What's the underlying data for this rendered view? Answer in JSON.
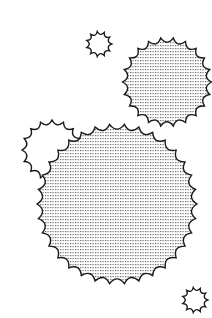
{
  "canvas": {
    "width": 212,
    "height": 318,
    "background": "#ffffff"
  },
  "style": {
    "stroke": "#1a1a1a",
    "stroke_width": 1.4,
    "dot_color": "#6a6a6a"
  },
  "shapes": [
    {
      "name": "small-star-top",
      "cx": 99,
      "cy": 44,
      "r": 10,
      "teeth": 11,
      "depth": 2.6,
      "filled": false
    },
    {
      "name": "medium-scalloped-circle",
      "cx": 167,
      "cy": 82,
      "r": 40,
      "teeth": 22,
      "depth": 4.5,
      "filled": true
    },
    {
      "name": "unfilled-scalloped-circle",
      "cx": 52,
      "cy": 150,
      "r": 26,
      "teeth": 16,
      "depth": 4,
      "filled": false
    },
    {
      "name": "large-scalloped-circle",
      "cx": 117,
      "cy": 204,
      "r": 75,
      "teeth": 34,
      "depth": 5,
      "filled": true
    },
    {
      "name": "small-star-bottom",
      "cx": 195,
      "cy": 300,
      "r": 10,
      "teeth": 11,
      "depth": 2.6,
      "filled": false
    }
  ]
}
